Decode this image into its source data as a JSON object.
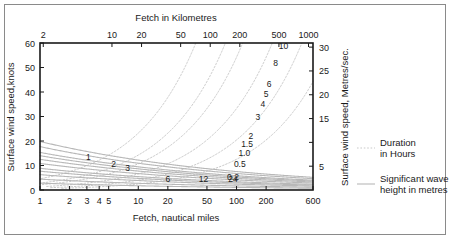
{
  "figure": {
    "background_color": "#ffffff",
    "border_color": "#8a8a8a",
    "axis_color": "#1a1a1a",
    "wave_curve_color": "#b8b8b8",
    "duration_curve_color": "#c9c9c9"
  },
  "titles": {
    "top": "Fetch in Kilometres",
    "bottom": "Fetch, nautical miles",
    "left": "Surface wind speed,knots",
    "right": "Surface wind speed, Metres/sec."
  },
  "legend": {
    "duration": {
      "line_1": "Duration",
      "line_2": "in Hours"
    },
    "wave": {
      "line_1": "Significant wave",
      "line_2": "height in metres"
    }
  },
  "chart_data": {
    "type": "line",
    "xlabel": "Fetch, nautical miles",
    "ylabel": "Surface wind speed,knots",
    "xlabel_top": "Fetch in Kilometres",
    "ylabel_right": "Surface wind speed, Metres/sec.",
    "x_scale": "log",
    "y_scale": "linear",
    "xlim": [
      1,
      600
    ],
    "ylim": [
      0,
      60
    ],
    "grid": false,
    "legend_position": "right-outside",
    "axes": {
      "bottom": {
        "label": "Fetch, nautical miles",
        "unit": "nautical miles",
        "ticks": [
          1,
          2,
          3,
          4,
          5,
          10,
          20,
          50,
          100,
          200,
          600
        ],
        "tick_labels": [
          "1",
          "2",
          "3",
          "4",
          "5",
          "10",
          "20",
          "50",
          "100",
          "200",
          "600"
        ]
      },
      "top": {
        "label": "Fetch in Kilometres",
        "unit": "kilometres",
        "ticks_km": [
          2,
          10,
          20,
          50,
          100,
          200,
          500,
          1000
        ],
        "tick_labels": [
          "2",
          "10",
          "20",
          "50",
          "100",
          "200",
          "500",
          "1000"
        ],
        "km_per_nautical_mile": 1.852
      },
      "left": {
        "label": "Surface wind speed,knots",
        "unit": "knots",
        "ticks": [
          0,
          10,
          20,
          30,
          40,
          50,
          60
        ],
        "tick_labels": [
          "0",
          "10",
          "20",
          "30",
          "40",
          "50",
          "60"
        ]
      },
      "right": {
        "label": "Surface wind speed, Metres/sec.",
        "unit": "metres/sec",
        "ticks": [
          5,
          10,
          15,
          20,
          25,
          30
        ],
        "tick_labels": [
          "5",
          "",
          "15",
          "20",
          "25",
          "30"
        ],
        "knots_per_mps": 1.9438
      }
    },
    "series": [
      {
        "name": "Significant wave height in metres",
        "style": "solid",
        "color": "#b8b8b8",
        "label_unit": "m",
        "contours": [
          {
            "label": "0.2",
            "value": 0.2,
            "label_x": 92,
            "label_y": 4.2
          },
          {
            "label": "0.5",
            "value": 0.5,
            "label_x": 108,
            "label_y": 9.5
          },
          {
            "label": "1.0",
            "value": 1.0,
            "label_x": 120,
            "label_y": 14.0
          },
          {
            "label": "1.5",
            "value": 1.5,
            "label_x": 128,
            "label_y": 17.5
          },
          {
            "label": "2",
            "value": 2.0,
            "label_x": 140,
            "label_y": 21.0
          },
          {
            "label": "3",
            "value": 3.0,
            "label_x": 165,
            "label_y": 28.5
          },
          {
            "label": "4",
            "value": 4.0,
            "label_x": 185,
            "label_y": 34.0
          },
          {
            "label": "5",
            "value": 5.0,
            "label_x": 200,
            "label_y": 38.0
          },
          {
            "label": "6",
            "value": 6.0,
            "label_x": 215,
            "label_y": 42.0
          },
          {
            "label": "8",
            "value": 8.0,
            "label_x": 250,
            "label_y": 50.5
          },
          {
            "label": "10",
            "value": 10.0,
            "label_x": 300,
            "label_y": 57.5
          }
        ]
      },
      {
        "name": "Duration in Hours",
        "style": "dashed",
        "color": "#c9c9c9",
        "label_unit": "h",
        "contours": [
          {
            "label": "1",
            "value": 1,
            "label_x": 3.1,
            "label_y": 12.2
          },
          {
            "label": "2",
            "value": 2,
            "label_x": 5.6,
            "label_y": 9.2
          },
          {
            "label": "3",
            "value": 3,
            "label_x": 7.8,
            "label_y": 7.6
          },
          {
            "label": "6",
            "value": 6,
            "label_x": 20,
            "label_y": 3.4
          },
          {
            "label": "12",
            "value": 12,
            "label_x": 46,
            "label_y": 3.4
          },
          {
            "label": "24",
            "value": 24,
            "label_x": 92,
            "label_y": 3.4
          }
        ]
      }
    ]
  }
}
